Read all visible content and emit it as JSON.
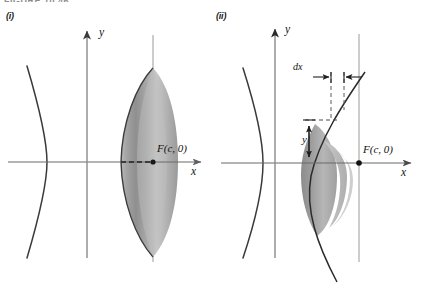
{
  "figure": {
    "clipped_header_text": "FIGURE 10.46",
    "panels": [
      {
        "id": "i",
        "label": "(i)",
        "axes": {
          "x_label": "x",
          "y_label": "y"
        },
        "annotations": [
          {
            "name": "focus-point-label",
            "text": "F(c, 0)"
          }
        ]
      },
      {
        "id": "ii",
        "label": "(ii)",
        "axes": {
          "x_label": "x",
          "y_label": "y"
        },
        "annotations": [
          {
            "name": "dx-label",
            "text": "dx"
          },
          {
            "name": "y-height-label",
            "text": "y"
          },
          {
            "name": "focus-point-label",
            "text": "F(c, 0)"
          }
        ]
      }
    ],
    "colors": {
      "background": "#ffffff",
      "axis": "#6b6b6b",
      "curve": "#2e2e2e",
      "solid_fill_light": "#d9d9d9",
      "solid_fill_mid": "#9e9e9e",
      "solid_fill_dark": "#787878",
      "dashed_guide": "#2e2e2e",
      "label_text": "#111111"
    }
  }
}
